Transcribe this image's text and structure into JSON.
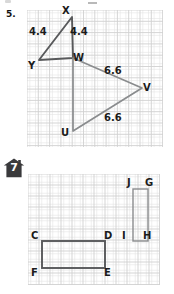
{
  "worksheet": {
    "problems": [
      {
        "number": "5.",
        "marker_type": "plain",
        "figure": {
          "type": "geometry-grid",
          "grid": {
            "cols": 12,
            "rows": 12,
            "cell_px": 11.3
          },
          "vertices": [
            {
              "name": "X",
              "x": 4.0,
              "y": 0.6
            },
            {
              "name": "Y",
              "x": 1.05,
              "y": 4.45
            },
            {
              "name": "W",
              "x": 4.05,
              "y": 4.25
            },
            {
              "name": "V",
              "x": 10.2,
              "y": 6.9
            },
            {
              "name": "U",
              "x": 4.05,
              "y": 10.6
            }
          ],
          "vertex_labels": [
            {
              "text": "X",
              "left": 62,
              "top": 6
            },
            {
              "text": "Y",
              "left": 28,
              "top": 62
            },
            {
              "text": "W",
              "left": 73,
              "top": 55
            },
            {
              "text": "V",
              "left": 143,
              "top": 84
            },
            {
              "text": "U",
              "left": 61,
              "top": 129
            }
          ],
          "side_labels": [
            {
              "text": "4.4",
              "left": 29,
              "top": 26
            },
            {
              "text": "4.4",
              "left": 70,
              "top": 26
            },
            {
              "text": "6.6",
              "left": 104,
              "top": 66
            },
            {
              "text": "6.6",
              "left": 104,
              "top": 113
            }
          ],
          "shapes": [
            {
              "id": "triangle-XYW",
              "points": "X,Y,W",
              "closed": true
            },
            {
              "id": "triangle-WUV",
              "points": "W,U,V",
              "closed": true
            }
          ]
        }
      },
      {
        "number": "7",
        "marker_type": "house-badge",
        "figure": {
          "type": "geometry-grid",
          "grid": {
            "cols": 12,
            "rows": 10,
            "cell_px": 11.0
          },
          "vertex_labels": [
            {
              "text": "C",
              "left": 31,
              "top": 232
            },
            {
              "text": "D",
              "left": 105,
              "top": 232
            },
            {
              "text": "E",
              "left": 105,
              "top": 268
            },
            {
              "text": "F",
              "left": 31,
              "top": 268
            },
            {
              "text": "I",
              "left": 121,
              "top": 232
            },
            {
              "text": "H",
              "left": 142,
              "top": 232
            },
            {
              "text": "J",
              "left": 126,
              "top": 179
            },
            {
              "text": "G",
              "left": 144,
              "top": 179
            }
          ],
          "shapes": [
            {
              "id": "rectangle-CDEF",
              "left": 42,
              "top": 241,
              "width": 63,
              "height": 27
            },
            {
              "id": "rectangle-JGHI",
              "left": 133,
              "top": 189,
              "width": 15,
              "height": 52
            }
          ]
        }
      }
    ]
  },
  "colors": {
    "grid_line": "#dcdcdc",
    "grid_line_major": "#cfcfcf",
    "grid_border": "#c9c9c9",
    "shape_stroke_dark": "#58595b",
    "shape_stroke_light": "#8a8c8e",
    "text": "#1b1b1b",
    "badge_fill": "#3a3a3c",
    "page_bg": "#ffffff"
  }
}
